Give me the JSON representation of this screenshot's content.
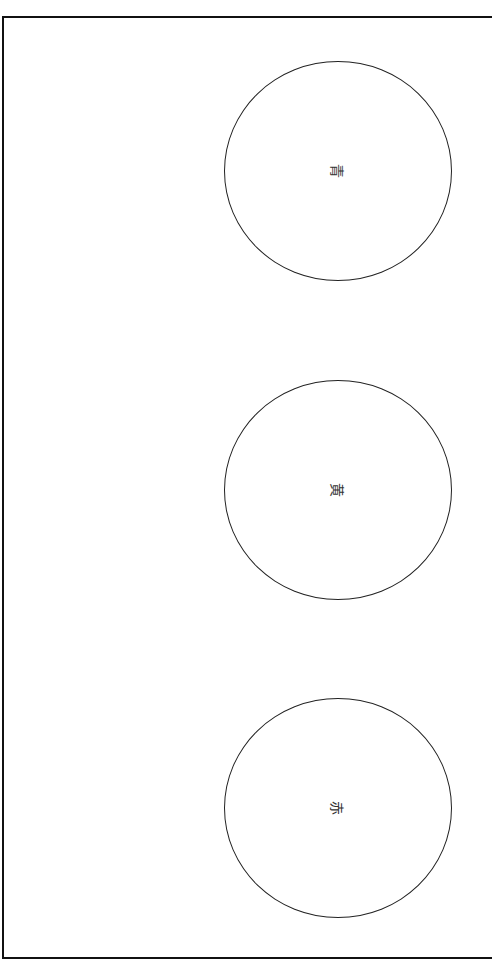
{
  "diagram": {
    "circles": [
      {
        "label": "青",
        "meaning": "blue",
        "center": [
          338,
          170
        ]
      },
      {
        "label": "黄",
        "meaning": "yellow",
        "center": [
          338,
          490
        ]
      },
      {
        "label": "赤",
        "meaning": "red",
        "center": [
          338,
          808
        ]
      }
    ],
    "text_orientation": "rotated 90deg clockwise"
  }
}
